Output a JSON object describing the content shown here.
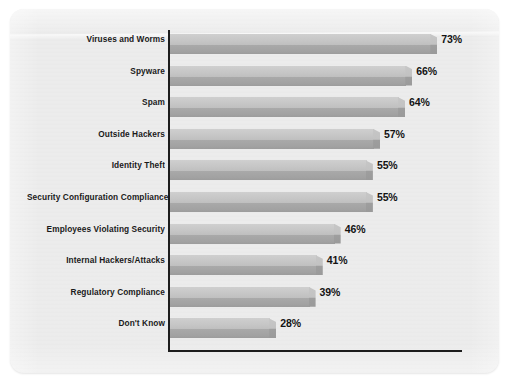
{
  "chart_data": {
    "type": "bar",
    "orientation": "horizontal",
    "title": "",
    "subtitle": "",
    "xlabel": "",
    "ylabel": "",
    "grid": false,
    "legend": null,
    "axis": {
      "value_suffix": "%",
      "xlim": [
        0,
        80
      ],
      "visible_ticks": [],
      "y_axis_line": true,
      "x_axis_line": true
    },
    "categories": [
      "Viruses and Worms",
      "Spyware",
      "Spam",
      "Outside Hackers",
      "Identity Theft",
      "Security Configuration Compliance",
      "Employees Violating Security",
      "Internal Hackers/Attacks",
      "Regulatory Compliance",
      "Don't Know"
    ],
    "values": [
      73,
      66,
      64,
      57,
      55,
      55,
      46,
      41,
      39,
      28
    ],
    "data_labels": [
      "73%",
      "66%",
      "64%",
      "57%",
      "55%",
      "55%",
      "46%",
      "41%",
      "39%",
      "28%"
    ],
    "series": [
      {
        "name": "Percent of respondents",
        "values": [
          73,
          66,
          64,
          57,
          55,
          55,
          46,
          41,
          39,
          28
        ]
      }
    ],
    "colors": {
      "bar_face": "#c6c6c6",
      "bar_shade": "#a2a2a2",
      "axis": "#1d1d1d",
      "label_text": "#1a1a1a",
      "value_text": "#131313",
      "plot_background": "#ececec",
      "page_background": "#ffffff"
    }
  }
}
